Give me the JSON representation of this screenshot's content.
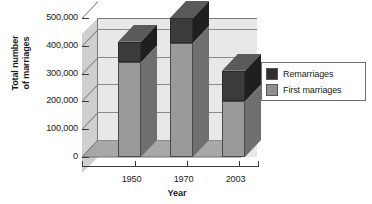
{
  "chart_data": {
    "type": "bar",
    "stacked": true,
    "title": "",
    "xlabel": "Year",
    "ylabel": "Total number of marriages",
    "categories": [
      "1950",
      "1970",
      "2003"
    ],
    "ytick_labels": [
      "0",
      "100,000",
      "200,000",
      "300,000",
      "400,000",
      "500,000"
    ],
    "ytick_values": [
      0,
      100000,
      200000,
      300000,
      400000,
      500000
    ],
    "ylim": [
      0,
      500000
    ],
    "grid": true,
    "legend_position": "right",
    "three_d": true,
    "series": [
      {
        "name": "First marriages",
        "color": "#9a9a9a",
        "values": [
          340000,
          410000,
          200000
        ]
      },
      {
        "name": "Remarriages",
        "color": "#3b3b3b",
        "values": [
          75000,
          90000,
          110000
        ]
      }
    ],
    "totals": [
      415000,
      500000,
      310000
    ]
  },
  "axes": {
    "y_title_line1": "Total number",
    "y_title_line2": "of marriages",
    "x_title": "Year",
    "y_ticks": [
      {
        "label": "500,000",
        "value": 500000
      },
      {
        "label": "400,000",
        "value": 400000
      },
      {
        "label": "300,000",
        "value": 300000
      },
      {
        "label": "200,000",
        "value": 200000
      },
      {
        "label": "100,000",
        "value": 100000
      },
      {
        "label": "0",
        "value": 0
      }
    ],
    "x_ticks": [
      {
        "label": "1950"
      },
      {
        "label": "1970"
      },
      {
        "label": "2003"
      }
    ]
  },
  "legend": {
    "entries": [
      {
        "label": "Remarriages",
        "swatch": "dark-swatch-icon",
        "color": "#2f2f2f"
      },
      {
        "label": "First marriages",
        "swatch": "light-swatch-icon",
        "color": "#8f8f8f"
      }
    ]
  },
  "colors": {
    "remarriages": "#3b3b3b",
    "first_marriages": "#9a9a9a",
    "back_wall": "#e8e8e8",
    "left_wall": "#cfcfcf",
    "floor": "#a8a8a8",
    "grid": "#8a8a8a",
    "text": "#1a1a1a"
  }
}
